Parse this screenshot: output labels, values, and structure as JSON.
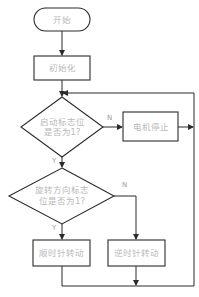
{
  "diagram": {
    "type": "flowchart",
    "nodes": {
      "start": {
        "label": "开始",
        "shape": "terminal"
      },
      "init": {
        "label": "初始化",
        "shape": "process"
      },
      "decision1": {
        "line1": "启动标志位",
        "line2": "是否为1?",
        "shape": "decision"
      },
      "motor_stop": {
        "label": "电机停止",
        "shape": "process"
      },
      "decision2": {
        "line1": "旋转方向标志",
        "line2": "位是否为1?",
        "shape": "decision"
      },
      "cw": {
        "label": "顺时针转动",
        "shape": "process"
      },
      "ccw": {
        "label": "逆时针转动",
        "shape": "process"
      }
    },
    "edge_labels": {
      "d1_no": "N",
      "d1_yes": "Y",
      "d2_no": "N",
      "d2_yes": "Y"
    },
    "edges": [
      [
        "start",
        "init"
      ],
      [
        "init",
        "decision1"
      ],
      [
        "decision1",
        "motor_stop",
        "N"
      ],
      [
        "decision1",
        "decision2",
        "Y"
      ],
      [
        "decision2",
        "cw",
        "Y"
      ],
      [
        "decision2",
        "ccw",
        "N"
      ],
      [
        "motor_stop",
        "loop-back"
      ],
      [
        "cw",
        "loop-back"
      ],
      [
        "ccw",
        "loop-back"
      ]
    ],
    "colors": {
      "line": "#2b2b2b",
      "text": "#b9b9b9"
    }
  }
}
